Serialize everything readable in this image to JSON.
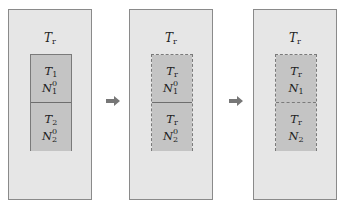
{
  "diagram": {
    "colors": {
      "outer_fill": "#e6e6e6",
      "outer_border": "#8a8a8a",
      "inner_fill": "#c4c4c4",
      "inner_border": "#7a7a7a",
      "arrow": "#777777"
    },
    "panels": [
      {
        "outer_label": {
          "base": "T",
          "sub": "r"
        },
        "inner_border": "solid",
        "divider": "solid",
        "cells": [
          {
            "top": {
              "base": "T",
              "sub": "1"
            },
            "bottom": {
              "base": "N",
              "sub": "1",
              "sup": "0"
            }
          },
          {
            "top": {
              "base": "T",
              "sub": "2"
            },
            "bottom": {
              "base": "N",
              "sub": "2",
              "sup": "0"
            }
          }
        ]
      },
      {
        "outer_label": {
          "base": "T",
          "sub": "r"
        },
        "inner_border": "dashed",
        "divider": "solid",
        "cells": [
          {
            "top": {
              "base": "T",
              "sub": "r"
            },
            "bottom": {
              "base": "N",
              "sub": "1",
              "sup": "0"
            }
          },
          {
            "top": {
              "base": "T",
              "sub": "r"
            },
            "bottom": {
              "base": "N",
              "sub": "2",
              "sup": "0"
            }
          }
        ]
      },
      {
        "outer_label": {
          "base": "T",
          "sub": "r"
        },
        "inner_border": "dashed",
        "divider": "dashed",
        "cells": [
          {
            "top": {
              "base": "T",
              "sub": "r"
            },
            "bottom": {
              "base": "N",
              "sub": "1"
            }
          },
          {
            "top": {
              "base": "T",
              "sub": "r"
            },
            "bottom": {
              "base": "N",
              "sub": "2"
            }
          }
        ]
      }
    ],
    "arrows": [
      {
        "icon": "right-arrow-icon",
        "from": 1,
        "to": 2
      },
      {
        "icon": "right-arrow-icon",
        "from": 2,
        "to": 3
      }
    ]
  }
}
